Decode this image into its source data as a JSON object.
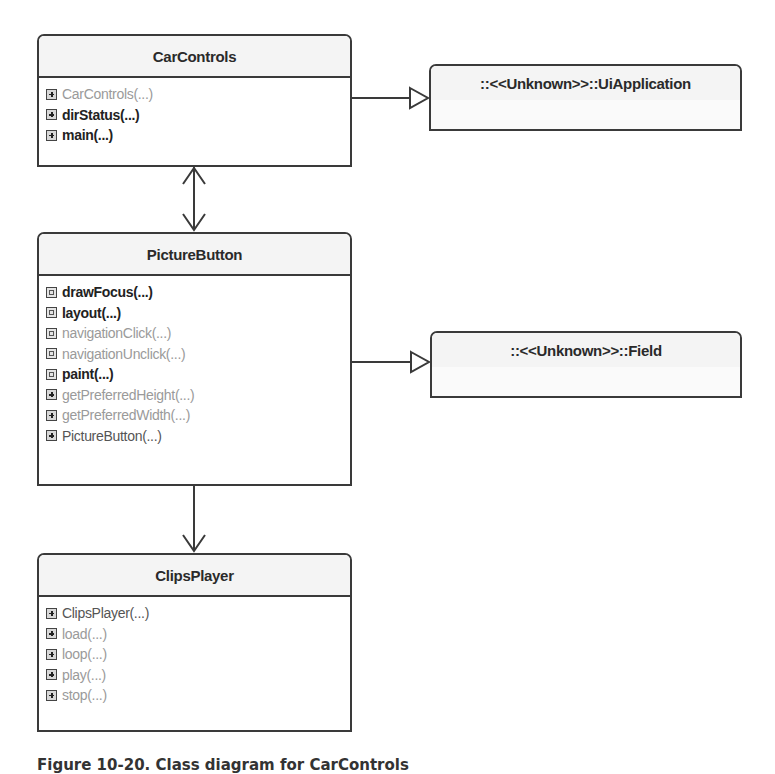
{
  "classes": {
    "car_controls": {
      "name": "CarControls",
      "members": [
        {
          "label": "CarControls(...)",
          "icon": "plus",
          "style": "dim"
        },
        {
          "label": "dirStatus(...)",
          "icon": "plus",
          "style": "pub"
        },
        {
          "label": "main(...)",
          "icon": "plus",
          "style": "pub"
        }
      ]
    },
    "ui_application": {
      "name": "::<<Unknown>>::UiApplication"
    },
    "picture_button": {
      "name": "PictureButton",
      "members": [
        {
          "label": "drawFocus(...)",
          "icon": "hash",
          "style": "pub"
        },
        {
          "label": "layout(...)",
          "icon": "hash",
          "style": "pub"
        },
        {
          "label": "navigationClick(...)",
          "icon": "hash",
          "style": "dim"
        },
        {
          "label": "navigationUnclick(...)",
          "icon": "hash",
          "style": "dim"
        },
        {
          "label": "paint(...)",
          "icon": "hash",
          "style": "pub"
        },
        {
          "label": "getPreferredHeight(...)",
          "icon": "plus",
          "style": "dim"
        },
        {
          "label": "getPreferredWidth(...)",
          "icon": "plus",
          "style": "dim"
        },
        {
          "label": "PictureButton(...)",
          "icon": "plus",
          "style": "mid"
        }
      ]
    },
    "field": {
      "name": "::<<Unknown>>::Field"
    },
    "clips_player": {
      "name": "ClipsPlayer",
      "members": [
        {
          "label": "ClipsPlayer(...)",
          "icon": "plus",
          "style": "mid"
        },
        {
          "label": "load(...)",
          "icon": "plus",
          "style": "dim"
        },
        {
          "label": "loop(...)",
          "icon": "plus",
          "style": "dim"
        },
        {
          "label": "play(...)",
          "icon": "plus",
          "style": "dim"
        },
        {
          "label": "stop(...)",
          "icon": "plus",
          "style": "dim"
        }
      ]
    }
  },
  "relations": [
    {
      "from": "CarControls",
      "to": "UiApplication",
      "type": "generalization"
    },
    {
      "from": "CarControls",
      "to": "PictureButton",
      "type": "bidirectional-association"
    },
    {
      "from": "PictureButton",
      "to": "Field",
      "type": "generalization"
    },
    {
      "from": "PictureButton",
      "to": "ClipsPlayer",
      "type": "directed-association"
    }
  ],
  "caption": "Figure 10-20. Class diagram for CarControls"
}
